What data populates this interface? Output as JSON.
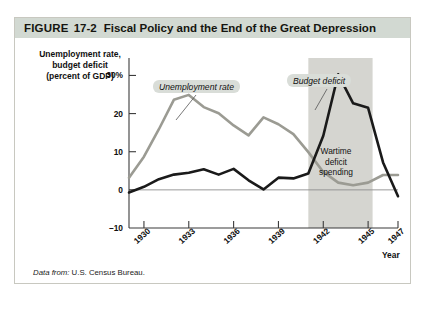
{
  "figure": {
    "label": "FIGURE",
    "number": "17-2",
    "title": "Fiscal Policy and the End of the Great Depression"
  },
  "source": {
    "prefix": "Data from:",
    "body": "U.S. Census Bureau."
  },
  "annotations": {
    "unemployment_callout": "Unemployment rate",
    "deficit_callout": "Budget deficit",
    "wartime_line1": "Wartime",
    "wartime_line2": "deficit",
    "wartime_line3": "spending"
  },
  "colors": {
    "header_background": "#d2d9d2",
    "card_border": "#c8c8c0",
    "unemployment_line": "#9b9b93",
    "deficit_line": "#1a1a1a",
    "war_band": "#d5d5d0",
    "callout_background": "#d9ddd8",
    "axis": "#3b3b3b"
  },
  "chart_data": {
    "type": "line",
    "title": "Fiscal Policy and the End of the Great Depression",
    "xlabel": "Year",
    "ylabel": "Unemployment rate, budget deficit (percent of GDP)",
    "ylabel_lines": [
      "Unemployment rate,",
      "budget deficit",
      "(percent of GDP)"
    ],
    "grid": false,
    "legend_position": "inline-callouts",
    "xlim": [
      1929,
      1947
    ],
    "ylim": [
      -10,
      33
    ],
    "yticks": [
      -10,
      0,
      10,
      20,
      30
    ],
    "ytick_labels": [
      "–10",
      "0",
      "10",
      "20",
      "30%"
    ],
    "xticks": [
      1930,
      1933,
      1936,
      1939,
      1942,
      1945,
      1947
    ],
    "xtick_labels": [
      "1930",
      "1933",
      "1936",
      "1939",
      "1942",
      "1945",
      "1947"
    ],
    "x": [
      1929,
      1930,
      1931,
      1932,
      1933,
      1934,
      1935,
      1936,
      1937,
      1938,
      1939,
      1940,
      1941,
      1942,
      1943,
      1944,
      1945,
      1946,
      1947
    ],
    "series": [
      {
        "name": "Unemployment rate",
        "color": "#9b9b93",
        "values": [
          3.2,
          8.7,
          15.9,
          23.6,
          24.9,
          21.7,
          20.1,
          16.9,
          14.3,
          19.0,
          17.2,
          14.6,
          9.9,
          4.7,
          1.9,
          1.2,
          1.9,
          3.9,
          3.9
        ]
      },
      {
        "name": "Budget deficit",
        "color": "#1a1a1a",
        "values": [
          -0.7,
          0.8,
          2.8,
          4.0,
          4.5,
          5.4,
          4.0,
          5.5,
          2.5,
          0.1,
          3.2,
          3.0,
          4.3,
          14.2,
          30.3,
          22.7,
          21.5,
          7.2,
          -1.7
        ]
      }
    ],
    "shaded_region": {
      "label": "Wartime deficit spending",
      "x_start": 1941,
      "x_end": 1945.3,
      "color": "#d5d5d0"
    },
    "annotations": [
      {
        "text": "Unemployment rate",
        "points_to_year": 1937,
        "style": "callout"
      },
      {
        "text": "Budget deficit",
        "points_to_year": 1943,
        "style": "callout"
      }
    ]
  }
}
